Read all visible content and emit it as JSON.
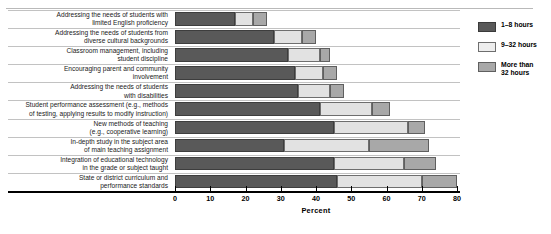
{
  "chart_data": {
    "type": "bar",
    "orientation": "horizontal",
    "stacked": true,
    "title": "",
    "xlabel": "Percent",
    "ylabel": "",
    "xlim": [
      0,
      80
    ],
    "xticks": [
      0,
      10,
      20,
      30,
      40,
      50,
      60,
      70,
      80
    ],
    "grid": false,
    "legend_position": "right",
    "categories": [
      "Addressing the needs of students with\nlimited English proficiency",
      "Addressing the needs of students from\ndiverse cultural backgrounds",
      "Classroom management, including\nstudent discipline",
      "Encouraging parent and community\ninvolvement",
      "Addressing the needs of students\nwith disabilities",
      "Student performance assessment (e.g., methods\nof testing, applying results to modify instruction)",
      "New methods of teaching\n(e.g., cooperative learning)",
      "In-depth study in the subject area\nof main teaching assignment",
      "Integration of educational technology\nin the grade or subject taught",
      "State or district curriculum and\nperformance standards"
    ],
    "series": [
      {
        "name": "1–8 hours",
        "color": "#595959",
        "values": [
          17,
          28,
          32,
          34,
          35,
          41,
          45,
          31,
          45,
          46
        ]
      },
      {
        "name": "9–32 hours",
        "color": "#e2e2e2",
        "values": [
          5,
          8,
          9,
          8,
          9,
          15,
          21,
          24,
          20,
          24
        ]
      },
      {
        "name": "More than\n32 hours",
        "color": "#a8a8a8",
        "values": [
          4,
          4,
          3,
          4,
          4,
          5,
          5,
          17,
          9,
          10
        ]
      }
    ]
  },
  "legend": {
    "items": [
      {
        "label": "1–8 hours",
        "swatch": "dark-gray-swatch"
      },
      {
        "label": "9–32 hours",
        "swatch": "light-gray-swatch"
      },
      {
        "label": "More than\n32 hours",
        "swatch": "medium-gray-swatch"
      }
    ]
  },
  "axis": {
    "title": "Percent",
    "tick_labels": [
      "0",
      "10",
      "20",
      "30",
      "40",
      "50",
      "60",
      "70",
      "80"
    ]
  }
}
